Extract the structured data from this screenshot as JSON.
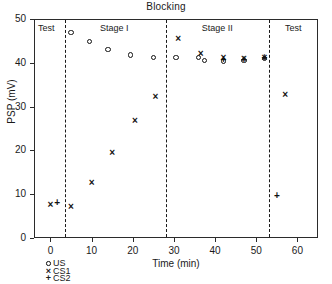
{
  "chart_data": {
    "type": "scatter",
    "title": "Blocking",
    "xlabel": "Time (min)",
    "ylabel": "PSP (mV)",
    "xlim": [
      -4,
      65
    ],
    "ylim": [
      0,
      50
    ],
    "xticks": [
      0,
      10,
      20,
      30,
      40,
      50,
      60
    ],
    "yticks": [
      0,
      10,
      20,
      30,
      40,
      50
    ],
    "grid": false,
    "legend_position": "below-axes-left",
    "phases": [
      {
        "label": "Test",
        "center_x": -1.0
      },
      {
        "label": "Stage I",
        "center_x": 15.5
      },
      {
        "label": "Stage II",
        "center_x": 40.5
      },
      {
        "label": "Test",
        "center_x": 59.0
      }
    ],
    "dividers": [
      3.5,
      28.0,
      53.0
    ],
    "series": [
      {
        "name": "US",
        "marker": "open-circle",
        "points": [
          {
            "x": 5.0,
            "y": 47.0
          },
          {
            "x": 9.5,
            "y": 44.8
          },
          {
            "x": 14.0,
            "y": 43.0
          },
          {
            "x": 19.5,
            "y": 41.8
          },
          {
            "x": 25.0,
            "y": 41.2
          },
          {
            "x": 30.5,
            "y": 41.2
          },
          {
            "x": 36.0,
            "y": 41.2
          },
          {
            "x": 37.5,
            "y": 40.5
          },
          {
            "x": 42.0,
            "y": 40.4
          },
          {
            "x": 47.0,
            "y": 40.5
          },
          {
            "x": 52.0,
            "y": 41.0
          }
        ]
      },
      {
        "name": "CS1",
        "marker": "cross-x",
        "points": [
          {
            "x": 0.0,
            "y": 7.6
          },
          {
            "x": 5.0,
            "y": 7.0
          },
          {
            "x": 10.0,
            "y": 12.6
          },
          {
            "x": 15.0,
            "y": 19.5
          },
          {
            "x": 20.5,
            "y": 26.6
          },
          {
            "x": 25.5,
            "y": 32.2
          },
          {
            "x": 31.0,
            "y": 45.4
          },
          {
            "x": 36.5,
            "y": 42.0
          },
          {
            "x": 42.0,
            "y": 41.0
          },
          {
            "x": 47.0,
            "y": 40.8
          },
          {
            "x": 52.0,
            "y": 41.2
          },
          {
            "x": 57.0,
            "y": 32.6
          }
        ]
      },
      {
        "name": "CS2",
        "marker": "plus",
        "points": [
          {
            "x": 1.6,
            "y": 8.0
          },
          {
            "x": 42.0,
            "y": 40.6
          },
          {
            "x": 47.0,
            "y": 40.6
          },
          {
            "x": 52.0,
            "y": 41.0
          },
          {
            "x": 55.0,
            "y": 9.6
          }
        ]
      }
    ],
    "legend": [
      {
        "label": "US",
        "marker": "open-circle"
      },
      {
        "label": "CS1",
        "marker": "cross-x"
      },
      {
        "label": "CS2",
        "marker": "plus"
      }
    ]
  }
}
